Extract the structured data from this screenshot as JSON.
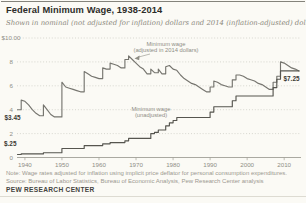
{
  "page": {
    "title": "Federal Minimum Wage, 1938-2014",
    "subtitle": "Shown in nominal (not adjusted for inflation) dollars and 2014 (inflation-adjusted) dollars",
    "note": "Note: Wage rates adjusted for inflation using implicit price deflator for personal consumption expenditures.",
    "source": "Source: Bureau of Labor Statistics, Bureau of Economic Analysis, Pew Research Center analysis",
    "brand": "PEW RESEARCH CENTER"
  },
  "colors": {
    "adjusted_line": "#76756f",
    "nominal_line": "#56554f",
    "grid": "#c9c8c0",
    "axis": "#a09f97",
    "text_muted": "#8f8e85",
    "text_dark": "#3a3934",
    "background": "#fbfaf5"
  },
  "chart_data": {
    "type": "line",
    "title": "Federal Minimum Wage, 1938-2014",
    "xlabel": "",
    "ylabel": "",
    "x_range": [
      1938,
      2014
    ],
    "y_range": [
      0,
      10
    ],
    "grid": "dotted horizontal",
    "legend_position": "inline labels",
    "y_gridlines": [
      {
        "value": 10,
        "label": "$10.00"
      },
      {
        "value": 8,
        "label": "8"
      },
      {
        "value": 6,
        "label": "6"
      },
      {
        "value": 4,
        "label": "4"
      },
      {
        "value": 2,
        "label": "2"
      },
      {
        "value": 0,
        "label": "0"
      }
    ],
    "x_ticks": [
      1940,
      1950,
      1960,
      1970,
      1980,
      1990,
      2000,
      2010
    ],
    "series": [
      {
        "name": "Minimum wage (adjusted in 2014 dollars)",
        "label_lines": [
          "Minimum wage",
          "(adjusted in 2014 dollars)"
        ],
        "color_key": "adjusted_line",
        "start_year": 1938,
        "values": [
          4.0,
          4.8,
          4.7,
          4.4,
          4.0,
          3.7,
          3.5,
          4.4,
          4.0,
          3.6,
          3.4,
          3.4,
          6.3,
          5.9,
          5.8,
          5.7,
          5.6,
          5.5,
          7.2,
          7.0,
          6.8,
          6.7,
          6.6,
          7.5,
          7.4,
          7.9,
          7.8,
          7.7,
          7.5,
          8.2,
          8.5,
          8.2,
          7.9,
          7.6,
          7.4,
          7.0,
          7.4,
          7.1,
          7.4,
          7.0,
          7.6,
          7.7,
          7.4,
          7.3,
          6.9,
          6.6,
          6.4,
          6.2,
          6.1,
          5.9,
          5.7,
          5.5,
          5.9,
          6.4,
          6.3,
          6.1,
          6.0,
          5.9,
          6.5,
          6.9,
          6.9,
          6.8,
          6.6,
          6.5,
          6.4,
          6.2,
          6.1,
          5.9,
          5.7,
          6.3,
          6.8,
          8.0,
          7.9,
          7.7,
          7.5,
          7.4,
          7.25
        ]
      },
      {
        "name": "Minimum wage (unadjusted)",
        "label_lines": [
          "Minimum wage",
          "(unadjusted)"
        ],
        "color_key": "nominal_line",
        "start_year": 1938,
        "values": [
          0.25,
          0.3,
          0.3,
          0.3,
          0.3,
          0.3,
          0.3,
          0.4,
          0.4,
          0.4,
          0.4,
          0.4,
          0.75,
          0.75,
          0.75,
          0.75,
          0.75,
          0.75,
          1.0,
          1.0,
          1.0,
          1.0,
          1.0,
          1.15,
          1.15,
          1.25,
          1.25,
          1.25,
          1.25,
          1.4,
          1.6,
          1.6,
          1.6,
          1.6,
          1.6,
          1.6,
          2.0,
          2.1,
          2.3,
          2.3,
          2.65,
          2.9,
          3.1,
          3.35,
          3.35,
          3.35,
          3.35,
          3.35,
          3.35,
          3.35,
          3.35,
          3.35,
          3.8,
          4.25,
          4.25,
          4.25,
          4.25,
          4.25,
          4.75,
          5.15,
          5.15,
          5.15,
          5.15,
          5.15,
          5.15,
          5.15,
          5.15,
          5.15,
          5.15,
          5.85,
          6.55,
          7.25,
          7.25,
          7.25,
          7.25,
          7.25,
          7.25
        ]
      }
    ],
    "annotations": [
      {
        "text": "$3.45",
        "series": "adjusted",
        "year": 1938,
        "value": 4.0,
        "dx": -13,
        "dy": 10.5
      },
      {
        "text": "$.25",
        "series": "nominal",
        "year": 1938,
        "value": 0.25,
        "dx": -13.5,
        "dy": -9
      },
      {
        "text": "$7.25",
        "series": "nominal",
        "year": 2014,
        "value": 7.25,
        "dx": -15.5,
        "dy": 10
      }
    ]
  }
}
